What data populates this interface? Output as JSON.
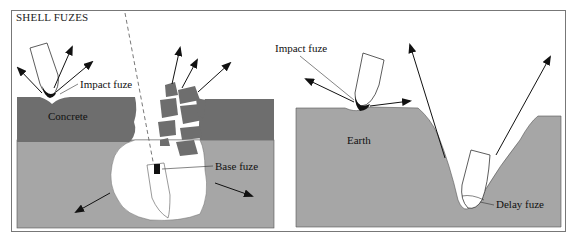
{
  "title": "SHELL FUZES",
  "left_panel": {
    "labels": {
      "impact_fuze": "Impact fuze",
      "concrete": "Concrete",
      "base_fuze": "Base fuze"
    }
  },
  "right_panel": {
    "labels": {
      "impact_fuze": "Impact fuze",
      "earth": "Earth",
      "delay_fuze": "Delay fuze"
    }
  },
  "colors": {
    "concrete": "#6e6e6e",
    "earth": "#a6a6a6",
    "frame": "#777777"
  }
}
